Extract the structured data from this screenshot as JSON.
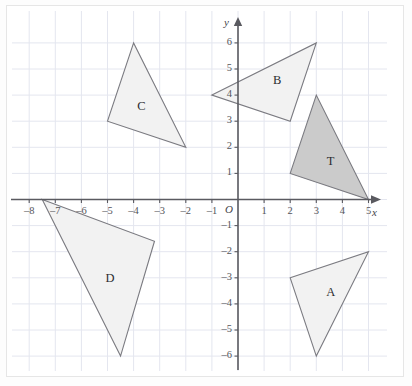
{
  "figure": {
    "background_color": "#ffffff",
    "frame_color": "#e6e6e6",
    "grid_color": "#e4e6ef",
    "axis_color": "#5a5a60",
    "outline_color": "#7a7a80"
  },
  "chart_data": {
    "type": "scatter",
    "title": "",
    "xlabel": "x",
    "ylabel": "y",
    "origin_label": "O",
    "grid": true,
    "legend": "none",
    "xlim": [
      -8.6,
      5.8
    ],
    "ylim": [
      -6.6,
      6.6
    ],
    "x_ticks": [
      -8,
      -7,
      -6,
      -5,
      -4,
      -3,
      -2,
      -1,
      1,
      2,
      3,
      4,
      5
    ],
    "x_tick_labels": [
      "–8",
      "–7",
      "–6",
      "–5",
      "–4",
      "–3",
      "–2",
      "–1",
      "1",
      "2",
      "3",
      "4",
      "5"
    ],
    "y_ticks": [
      6,
      5,
      4,
      3,
      2,
      1,
      -1,
      -2,
      -3,
      -4,
      -5,
      -6
    ],
    "y_tick_labels": [
      "6",
      "5",
      "4",
      "3",
      "2",
      "1",
      "–1",
      "–2",
      "–3",
      "–4",
      "–5",
      "–6"
    ],
    "shapes": [
      {
        "name": "T",
        "label": "T",
        "vertices": [
          [
            2,
            1
          ],
          [
            3,
            4
          ],
          [
            5,
            0
          ]
        ],
        "fill": "#cbcbcb",
        "stroke": "#7a7a80",
        "label_pos": [
          3.55,
          1.45
        ]
      },
      {
        "name": "A",
        "label": "A",
        "vertices": [
          [
            2,
            -3
          ],
          [
            5,
            -2
          ],
          [
            3,
            -6
          ]
        ],
        "fill": "#f2f2f2",
        "stroke": "#7a7a80",
        "label_pos": [
          3.55,
          -3.6
        ]
      },
      {
        "name": "B",
        "label": "B",
        "vertices": [
          [
            -1,
            4
          ],
          [
            3,
            6
          ],
          [
            2,
            3
          ]
        ],
        "fill": "#f2f2f2",
        "stroke": "#7a7a80",
        "label_pos": [
          1.5,
          4.55
        ]
      },
      {
        "name": "C",
        "label": "C",
        "vertices": [
          [
            -5,
            3
          ],
          [
            -4,
            6
          ],
          [
            -2,
            2
          ]
        ],
        "fill": "#f2f2f2",
        "stroke": "#7a7a80",
        "label_pos": [
          -3.7,
          3.55
        ]
      },
      {
        "name": "D",
        "label": "D",
        "vertices": [
          [
            -7.5,
            0
          ],
          [
            -3.2,
            -1.6
          ],
          [
            -4.5,
            -6
          ]
        ],
        "fill": "#f2f2f2",
        "stroke": "#7a7a80",
        "label_pos": [
          -4.9,
          -3.05
        ]
      }
    ]
  }
}
